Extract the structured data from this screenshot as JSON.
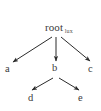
{
  "figure": {
    "type": "tree-diagram",
    "background_color": "#ffffff",
    "line_color": "#2b2b2b",
    "text_color": "#3b3b3b"
  },
  "nodes": {
    "root": {
      "label": "root",
      "subscript": "lux"
    },
    "a": {
      "label": "a"
    },
    "b": {
      "label": "b"
    },
    "c": {
      "label": "c"
    },
    "d": {
      "label": "d"
    },
    "e": {
      "label": "e"
    }
  },
  "edges": [
    {
      "from": "root",
      "to": "a"
    },
    {
      "from": "root",
      "to": "b"
    },
    {
      "from": "root",
      "to": "c"
    },
    {
      "from": "b",
      "to": "d"
    },
    {
      "from": "b",
      "to": "e"
    }
  ]
}
